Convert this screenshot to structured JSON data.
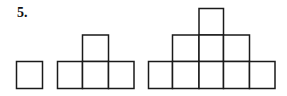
{
  "problem": {
    "number_label": "5.",
    "description": "Sequence of square-tile figures forming growing pyramids",
    "stroke_color": "#1a1a1a",
    "fill_color": "#ffffff",
    "square_size": 26,
    "figures": [
      {
        "index": 1,
        "rows": [
          {
            "count": 1
          }
        ],
        "total_squares": 1
      },
      {
        "index": 2,
        "rows": [
          {
            "count": 1
          },
          {
            "count": 3
          }
        ],
        "total_squares": 4
      },
      {
        "index": 3,
        "rows": [
          {
            "count": 1
          },
          {
            "count": 3
          },
          {
            "count": 5
          }
        ],
        "total_squares": 9
      }
    ]
  }
}
